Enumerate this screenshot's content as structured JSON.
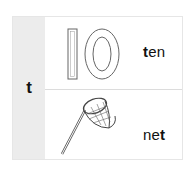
{
  "letter": "t",
  "rows": [
    {
      "picture": "number-ten-outline",
      "numeral": "10",
      "word_before": "",
      "highlight": "t",
      "word_after": "en"
    },
    {
      "picture": "butterfly-net",
      "word_before": "ne",
      "highlight": "t",
      "word_after": ""
    }
  ]
}
